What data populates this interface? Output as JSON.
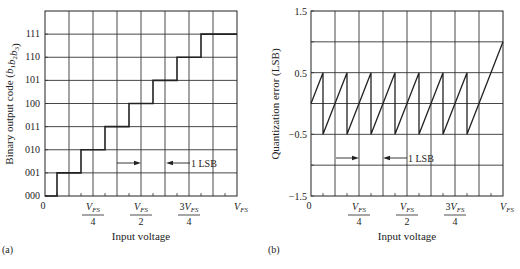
{
  "chart_data": [
    {
      "panel": "(a)",
      "type": "line",
      "subtype": "step",
      "title": "",
      "xlabel": "Input voltage",
      "ylabel": "Binary output code (b1 b2 b3)",
      "x_tick_labels": [
        "0",
        "VFS/4",
        "VFS/2",
        "3VFS/4",
        "VFS"
      ],
      "y_tick_labels": [
        "000",
        "001",
        "010",
        "011",
        "100",
        "101",
        "110",
        "111"
      ],
      "xlim": [
        0,
        1
      ],
      "x_unit": "fraction of VFS",
      "grid": true,
      "steps": {
        "x_transitions": [
          0.0625,
          0.1875,
          0.3125,
          0.4375,
          0.5625,
          0.6875,
          0.8125
        ],
        "codes": [
          "000",
          "001",
          "010",
          "011",
          "100",
          "101",
          "110",
          "111"
        ]
      },
      "annotation": "1 LSB"
    },
    {
      "panel": "(b)",
      "type": "line",
      "subtype": "sawtooth",
      "title": "",
      "xlabel": "Input voltage",
      "ylabel": "Quantization error (LSB)",
      "x_tick_labels": [
        "0",
        "VFS/4",
        "VFS/2",
        "3VFS/4",
        "VFS"
      ],
      "y_tick_labels": [
        "1.5",
        "0.5",
        "-0.5",
        "-1.5"
      ],
      "ylim": [
        -1.5,
        1.5
      ],
      "xlim": [
        0,
        1
      ],
      "grid": true,
      "x": [
        0,
        0.0625,
        0.0625,
        0.1875,
        0.1875,
        0.3125,
        0.3125,
        0.4375,
        0.4375,
        0.5625,
        0.5625,
        0.6875,
        0.6875,
        0.8125,
        0.8125,
        1.0
      ],
      "y": [
        0,
        0.5,
        -0.5,
        0.5,
        -0.5,
        0.5,
        -0.5,
        0.5,
        -0.5,
        0.5,
        -0.5,
        0.5,
        -0.5,
        0.5,
        -0.5,
        1.0
      ],
      "annotation": "1 LSB"
    }
  ],
  "labels": {
    "panel_a": "(a)",
    "panel_b": "(b)",
    "xlabel": "Input voltage",
    "ylabel_a": "Binary output code (",
    "ylabel_b": "Quantization error (LSB)",
    "lsb": "1 LSB",
    "zero": "0",
    "vfs": "V",
    "fs_sub": "FS",
    "four": "4",
    "two": "2",
    "three": "3",
    "codes": [
      "000",
      "001",
      "010",
      "011",
      "100",
      "101",
      "110",
      "111"
    ],
    "err_ticks": [
      "1.5",
      "0.5",
      "−0.5",
      "−1.5"
    ]
  }
}
